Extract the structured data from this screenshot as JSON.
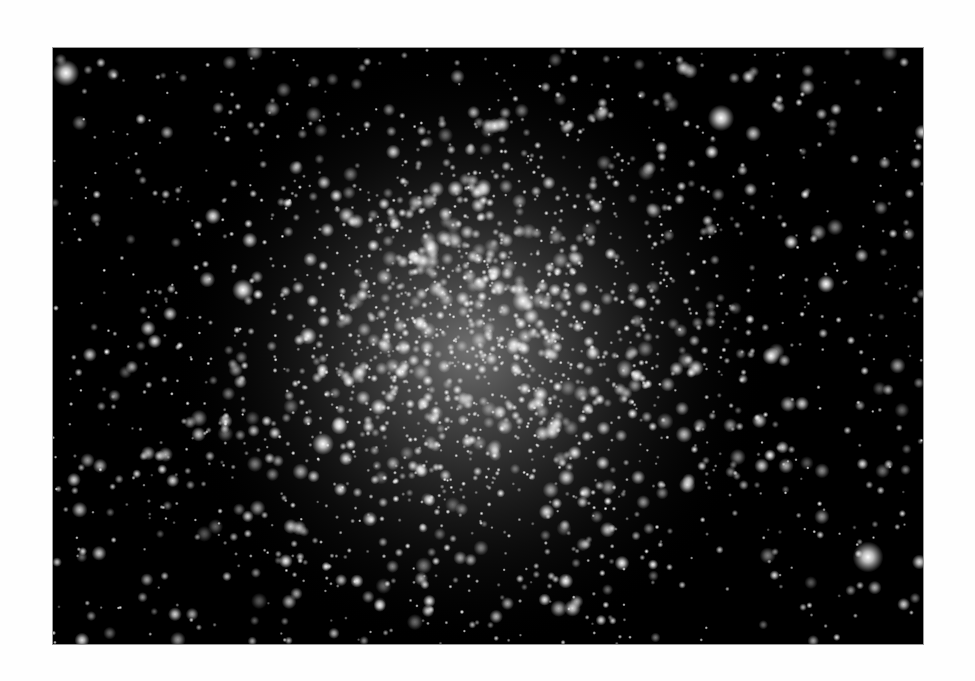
{
  "image": {
    "subject": "globular star cluster",
    "description": "Grayscale astrophotograph of a dense globular star cluster on a black sky background, framed by white margins",
    "frame": {
      "x": 53,
      "y": 48,
      "width": 870,
      "height": 596
    },
    "colors": {
      "page_background": "#fefefe",
      "sky": "#000000",
      "star": "#ffffff",
      "core_glow": "#8c8c8c"
    },
    "cluster": {
      "center_x": 417,
      "center_y": 302,
      "core_radius": 120,
      "halo_radius": 300
    },
    "bright_stars": [
      {
        "x": 13,
        "y": 25,
        "r": 6
      },
      {
        "x": 668,
        "y": 70,
        "r": 6
      },
      {
        "x": 815,
        "y": 509,
        "r": 7
      },
      {
        "x": 190,
        "y": 242,
        "r": 5
      },
      {
        "x": 270,
        "y": 396,
        "r": 5
      },
      {
        "x": 470,
        "y": 253,
        "r": 5
      },
      {
        "x": 378,
        "y": 200,
        "r": 4
      },
      {
        "x": 255,
        "y": 288,
        "r": 4
      },
      {
        "x": 773,
        "y": 236,
        "r": 4
      },
      {
        "x": 718,
        "y": 308,
        "r": 4
      }
    ],
    "field_star_count": 900,
    "cluster_star_count": 1400,
    "seed": 42
  }
}
